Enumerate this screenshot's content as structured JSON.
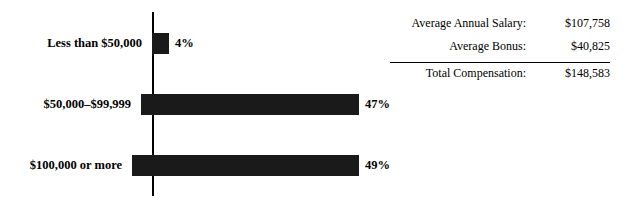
{
  "chart_data": {
    "type": "bar",
    "orientation": "horizontal",
    "categories": [
      "Less than $50,000",
      "$50,000–$99,999",
      "$100,000 or more"
    ],
    "values": [
      4,
      47,
      49
    ],
    "value_labels": [
      "4%",
      "47%",
      "49%"
    ],
    "title": "",
    "xlabel": "",
    "ylabel": "",
    "xlim": [
      0,
      50
    ],
    "grid": false,
    "legend": "none",
    "bar_color": "#1a1a1a"
  },
  "summary": {
    "rows": [
      {
        "label": "Average Annual Salary:",
        "value": "$107,758"
      },
      {
        "label": "Average Bonus:",
        "value": "$40,825"
      },
      {
        "label": "Total Compensation:",
        "value": "$148,583"
      }
    ]
  }
}
